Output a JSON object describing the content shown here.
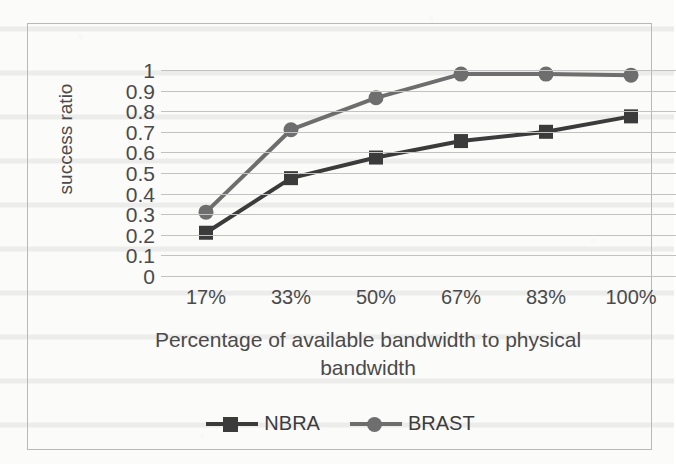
{
  "chart_data": {
    "type": "line",
    "title": "",
    "xlabel": "Percentage of available bandwidth to physical bandwidth",
    "ylabel": "success ratio",
    "categories": [
      "17%",
      "33%",
      "50%",
      "67%",
      "83%",
      "100%"
    ],
    "ylim": [
      0,
      1
    ],
    "ytick_labels": [
      "1",
      "0.9",
      "0.8",
      "0.7",
      "0.6",
      "0.5",
      "0.4",
      "0.3",
      "0.2",
      "0.1",
      "0"
    ],
    "ytick_values": [
      1,
      0.9,
      0.8,
      0.7,
      0.6,
      0.5,
      0.4,
      0.3,
      0.2,
      0.1,
      0
    ],
    "grid": true,
    "grid_axis": "y",
    "legend_position": "bottom",
    "series": [
      {
        "name": "NBRA",
        "marker": "square",
        "color": "#3b3b3b",
        "values": [
          0.21,
          0.475,
          0.575,
          0.655,
          0.7,
          0.775
        ]
      },
      {
        "name": "BRAST",
        "marker": "circle",
        "color": "#6e6e6e",
        "values": [
          0.31,
          0.71,
          0.865,
          0.98,
          0.98,
          0.975
        ]
      }
    ]
  },
  "axis_title_lines": [
    "Percentage of available bandwidth to physical",
    "bandwidth"
  ],
  "colors": {
    "nbra": "#3b3b3b",
    "brast": "#6e6e6e",
    "gridline": "#c2c2c2",
    "frame": "#b9b9b9",
    "text": "#4a4a4a"
  }
}
